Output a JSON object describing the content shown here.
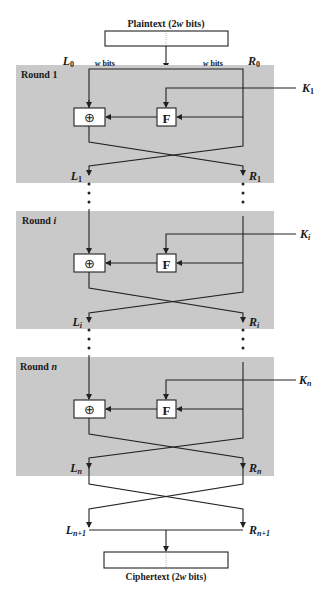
{
  "diagram": {
    "plaintext": {
      "label": "Plaintext (2",
      "var": "w",
      "suffix": " bits)"
    },
    "ciphertext": {
      "label": "Ciphertext (2",
      "var": "w",
      "suffix": " bits)"
    },
    "half_width_label": {
      "var": "w",
      "suffix": " bits"
    },
    "function_label": "F",
    "xor_symbol": "⊕",
    "initial": {
      "left": {
        "base": "L",
        "sub": "0"
      },
      "right": {
        "base": "R",
        "sub": "0"
      }
    },
    "rounds": [
      {
        "label": "Round 1",
        "label_base": "Round ",
        "label_var": "1",
        "var_italic": false,
        "key": {
          "base": "K",
          "sub": "1",
          "sub_italic": false
        },
        "out_left": {
          "base": "L",
          "sub": "1",
          "sub_italic": false
        },
        "out_right": {
          "base": "R",
          "sub": "1",
          "sub_italic": false
        }
      },
      {
        "label": "Round i",
        "label_base": "Round ",
        "label_var": "i",
        "var_italic": true,
        "key": {
          "base": "K",
          "sub": "i",
          "sub_italic": true
        },
        "out_left": {
          "base": "L",
          "sub": "i",
          "sub_italic": true
        },
        "out_right": {
          "base": "R",
          "sub": "i",
          "sub_italic": true
        }
      },
      {
        "label": "Round n",
        "label_base": "Round ",
        "label_var": "n",
        "var_italic": true,
        "key": {
          "base": "K",
          "sub": "n",
          "sub_italic": true
        },
        "out_left": {
          "base": "L",
          "sub": "n",
          "sub_italic": true
        },
        "out_right": {
          "base": "R",
          "sub": "n",
          "sub_italic": true
        }
      }
    ],
    "final": {
      "left": {
        "base": "L",
        "sub": "n+1"
      },
      "right": {
        "base": "R",
        "sub": "n+1"
      }
    },
    "colors": {
      "round_fill": "#c9c9c9",
      "line": "#222222",
      "box_fill": "#ffffff"
    }
  }
}
